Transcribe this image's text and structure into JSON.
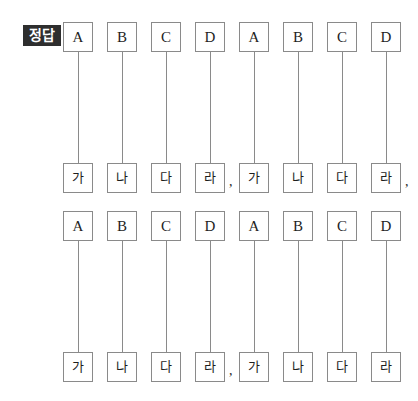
{
  "badge": {
    "label": "정답",
    "background_color": "#2e2e2e",
    "text_color": "#ffffff"
  },
  "style": {
    "page_background": "#ffffff",
    "box_border_color": "#8a8a8a",
    "line_color": "#8a8a8a",
    "text_color": "#1e1e1e"
  },
  "groups": [
    {
      "id": "group-1",
      "top_row": [
        {
          "label": "A"
        },
        {
          "label": "B"
        },
        {
          "label": "C"
        },
        {
          "label": "D"
        },
        {
          "label": "A"
        },
        {
          "label": "B"
        },
        {
          "label": "C"
        },
        {
          "label": "D"
        }
      ],
      "bottom_row": [
        {
          "label": "가",
          "separator": ""
        },
        {
          "label": "나",
          "separator": ""
        },
        {
          "label": "다",
          "separator": ""
        },
        {
          "label": "라",
          "separator": ","
        },
        {
          "label": "가",
          "separator": ""
        },
        {
          "label": "나",
          "separator": ""
        },
        {
          "label": "다",
          "separator": ""
        },
        {
          "label": "라",
          "separator": ","
        }
      ],
      "connections": [
        {
          "from": "A",
          "to": "가"
        },
        {
          "from": "B",
          "to": "나"
        },
        {
          "from": "C",
          "to": "다"
        },
        {
          "from": "D",
          "to": "라"
        },
        {
          "from": "A",
          "to": "가"
        },
        {
          "from": "B",
          "to": "나"
        },
        {
          "from": "C",
          "to": "다"
        },
        {
          "from": "D",
          "to": "라"
        }
      ]
    },
    {
      "id": "group-2",
      "top_row": [
        {
          "label": "A"
        },
        {
          "label": "B"
        },
        {
          "label": "C"
        },
        {
          "label": "D"
        },
        {
          "label": "A"
        },
        {
          "label": "B"
        },
        {
          "label": "C"
        },
        {
          "label": "D"
        }
      ],
      "bottom_row": [
        {
          "label": "가",
          "separator": ""
        },
        {
          "label": "나",
          "separator": ""
        },
        {
          "label": "다",
          "separator": ""
        },
        {
          "label": "라",
          "separator": ","
        },
        {
          "label": "가",
          "separator": ""
        },
        {
          "label": "나",
          "separator": ""
        },
        {
          "label": "다",
          "separator": ""
        },
        {
          "label": "라",
          "separator": ""
        }
      ],
      "connections": [
        {
          "from": "A",
          "to": "가"
        },
        {
          "from": "B",
          "to": "나"
        },
        {
          "from": "C",
          "to": "다"
        },
        {
          "from": "D",
          "to": "라"
        },
        {
          "from": "A",
          "to": "가"
        },
        {
          "from": "B",
          "to": "나"
        },
        {
          "from": "C",
          "to": "다"
        },
        {
          "from": "D",
          "to": "라"
        }
      ]
    }
  ],
  "layout": {
    "column_x": [
      63,
      107,
      151,
      195,
      239,
      283,
      327,
      371
    ]
  }
}
